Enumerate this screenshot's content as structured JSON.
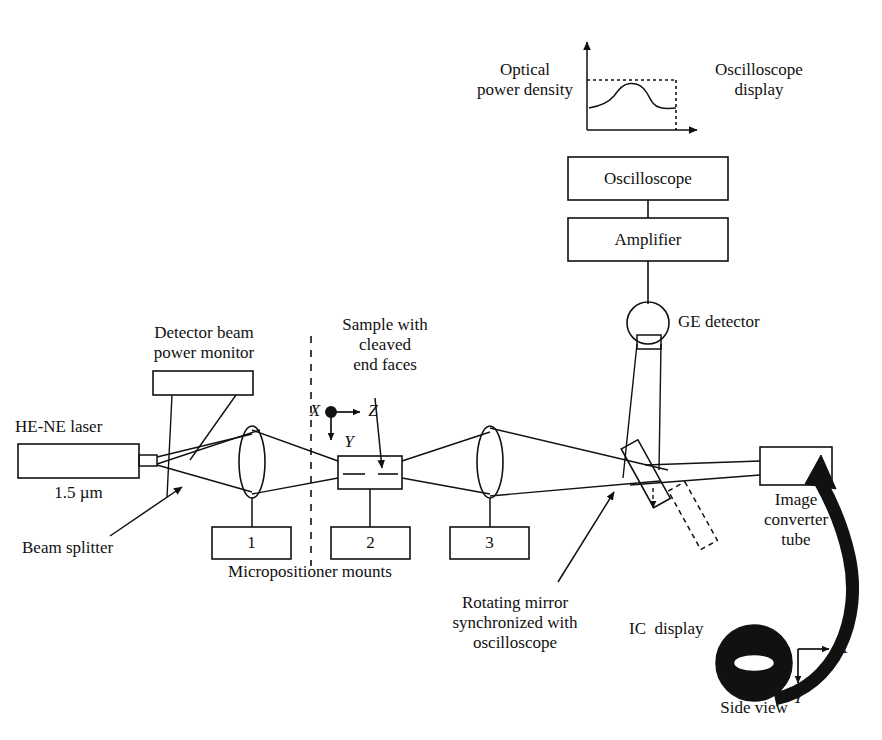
{
  "figure": {
    "type": "schematic-diagram",
    "background": "#ffffff",
    "line_color": "#111111"
  },
  "labels": {
    "optical_power_density": "Optical\npower density",
    "oscilloscope_display": "Oscilloscope\ndisplay",
    "oscilloscope_box": "Oscilloscope",
    "amplifier_box": "Amplifier",
    "ge_detector": "GE detector",
    "detector_beam_power_monitor": "Detector beam\npower monitor",
    "sample_with_cleaved_end_faces": "Sample with\ncleaved\nend faces",
    "he_ne_laser": "HE-NE laser",
    "wavelength": "1.5 µm",
    "beam_splitter": "Beam splitter",
    "micropositioner_mounts": "Micropositioner mounts",
    "mount_1": "1",
    "mount_2": "2",
    "mount_3": "3",
    "rotating_mirror": "Rotating mirror\nsynchronized with\noscilloscope",
    "image_converter_tube": "Image\nconverter\ntube",
    "ic_display": "IC  display",
    "side_view": "Side view",
    "axis_x_main": "X",
    "axis_y_main": "Y",
    "axis_z_main": "Z",
    "axis_x_side": "X",
    "axis_y_side": "Y"
  },
  "components": [
    {
      "name": "oscilloscope-waveform-plot",
      "kind": "inset-plot"
    },
    {
      "name": "oscilloscope-box",
      "kind": "rect"
    },
    {
      "name": "amplifier-box",
      "kind": "rect"
    },
    {
      "name": "ge-detector",
      "kind": "circle-with-rect"
    },
    {
      "name": "detector-beam-power-monitor-box",
      "kind": "rect"
    },
    {
      "name": "he-ne-laser-box",
      "kind": "rect-with-nozzle"
    },
    {
      "name": "lens-1",
      "kind": "ellipse"
    },
    {
      "name": "lens-2",
      "kind": "ellipse"
    },
    {
      "name": "sample-box",
      "kind": "rect-with-dashed-midline"
    },
    {
      "name": "micropositioner-mount-1",
      "kind": "rect"
    },
    {
      "name": "micropositioner-mount-2",
      "kind": "rect"
    },
    {
      "name": "micropositioner-mount-3",
      "kind": "rect"
    },
    {
      "name": "rotating-mirror",
      "kind": "tilted-rect"
    },
    {
      "name": "rotating-mirror-ghost",
      "kind": "tilted-rect-dashed"
    },
    {
      "name": "image-converter-tube-box",
      "kind": "rect"
    },
    {
      "name": "ic-display-disc",
      "kind": "filled-circle-with-slot"
    },
    {
      "name": "reference-plane-dashed-line",
      "kind": "dashed-vline"
    },
    {
      "name": "axis-indicator-main",
      "kind": "axis-triad"
    },
    {
      "name": "axis-indicator-side",
      "kind": "axis-pair"
    },
    {
      "name": "thick-curved-arrow",
      "kind": "arrow"
    }
  ]
}
